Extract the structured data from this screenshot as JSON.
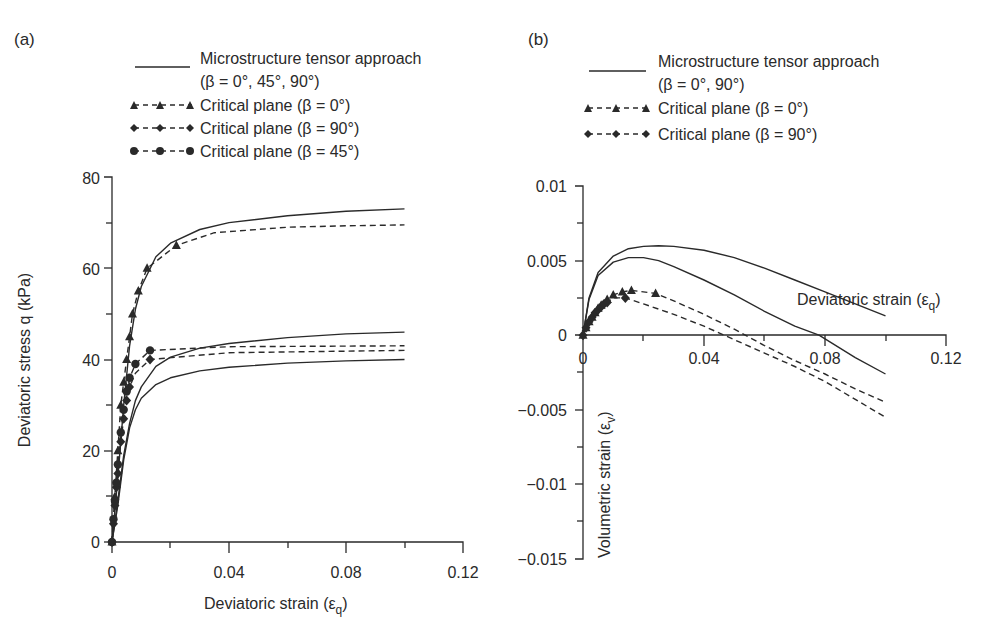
{
  "chart_data": [
    {
      "panel": "(a)",
      "type": "line",
      "title": "",
      "xlabel": "Deviatoric strain (εq)",
      "ylabel": "Deviatoric stress q (kPa)",
      "xlim": [
        0,
        0.12
      ],
      "ylim": [
        0,
        80
      ],
      "xticks": [
        "0",
        "0.04",
        "0.08",
        "0.12"
      ],
      "yticks": [
        "0",
        "20",
        "40",
        "60",
        "80"
      ],
      "grid": false,
      "legend": [
        {
          "label": "Microstructure tensor approach",
          "sublabel": "(β = 0°, 45°, 90°)",
          "style": "solid"
        },
        {
          "label": "Critical plane (β = 0°)",
          "style": "dashed-triangle"
        },
        {
          "label": "Critical plane (β = 90°)",
          "style": "dashed-diamond"
        },
        {
          "label": "Critical plane (β = 45°)",
          "style": "dashed-circle"
        }
      ],
      "series": [
        {
          "name": "Microstructure tensor (β = 0°)",
          "style": "solid",
          "x": [
            0,
            0.002,
            0.004,
            0.006,
            0.008,
            0.01,
            0.015,
            0.02,
            0.03,
            0.04,
            0.06,
            0.08,
            0.1
          ],
          "y": [
            0,
            14,
            30,
            43,
            51,
            56,
            62.5,
            65.5,
            68.5,
            70,
            71.5,
            72.5,
            73
          ]
        },
        {
          "name": "Microstructure tensor (β = 45°)",
          "style": "solid",
          "x": [
            0,
            0.002,
            0.004,
            0.006,
            0.008,
            0.01,
            0.015,
            0.02,
            0.03,
            0.04,
            0.06,
            0.08,
            0.1
          ],
          "y": [
            0,
            9,
            19,
            26,
            31,
            34,
            38.5,
            40.5,
            42.5,
            43.5,
            44.8,
            45.6,
            46
          ]
        },
        {
          "name": "Microstructure tensor (β = 90°)",
          "style": "solid",
          "x": [
            0,
            0.002,
            0.004,
            0.006,
            0.008,
            0.01,
            0.015,
            0.02,
            0.03,
            0.04,
            0.06,
            0.08,
            0.1
          ],
          "y": [
            0,
            8,
            18,
            25,
            29,
            31.5,
            34.5,
            36,
            37.5,
            38.3,
            39.2,
            39.7,
            40
          ]
        },
        {
          "name": "Critical plane (β = 0°)",
          "style": "dashed",
          "marker": "triangle",
          "x": [
            0,
            0.001,
            0.002,
            0.003,
            0.004,
            0.005,
            0.006,
            0.007,
            0.009,
            0.012,
            0.022,
            0.035,
            0.06,
            0.08,
            0.1
          ],
          "y": [
            0,
            10,
            20,
            30,
            35,
            40,
            45,
            50,
            55,
            60,
            65,
            67.8,
            69,
            69.3,
            69.5
          ],
          "markers_x": [
            0,
            0.001,
            0.002,
            0.003,
            0.004,
            0.005,
            0.006,
            0.007,
            0.009,
            0.012,
            0.022
          ],
          "markers_y": [
            0,
            10,
            20,
            30,
            35,
            40,
            45,
            50,
            55,
            60,
            65
          ]
        },
        {
          "name": "Critical plane (β = 90°)",
          "style": "dashed",
          "marker": "diamond",
          "x": [
            0,
            0.001,
            0.002,
            0.003,
            0.004,
            0.005,
            0.006,
            0.008,
            0.013,
            0.04,
            0.1
          ],
          "y": [
            0,
            8,
            15,
            22,
            27,
            31,
            34,
            37,
            40,
            41.5,
            42
          ],
          "markers_x": [
            0,
            0.0005,
            0.001,
            0.0015,
            0.002,
            0.003,
            0.004,
            0.005,
            0.006,
            0.013
          ],
          "markers_y": [
            0,
            4,
            8,
            12,
            15,
            22,
            27,
            31,
            34,
            40
          ]
        },
        {
          "name": "Critical plane (β = 45°)",
          "style": "dashed",
          "marker": "circle",
          "x": [
            0,
            0.001,
            0.002,
            0.003,
            0.004,
            0.005,
            0.006,
            0.008,
            0.013,
            0.04,
            0.1
          ],
          "y": [
            0,
            9,
            17,
            24,
            29,
            33,
            36,
            39,
            42,
            42.8,
            43
          ],
          "markers_x": [
            0,
            0.0005,
            0.001,
            0.0015,
            0.002,
            0.003,
            0.004,
            0.005,
            0.006,
            0.008,
            0.013
          ],
          "markers_y": [
            0,
            5,
            9,
            13,
            17,
            24,
            29,
            33,
            36,
            39,
            42
          ]
        }
      ]
    },
    {
      "panel": "(b)",
      "type": "line",
      "title": "",
      "xlabel": "Deviatoric strain (εq)",
      "ylabel": "Volumetric strain (εv)",
      "xlim": [
        0,
        0.12
      ],
      "ylim": [
        -0.015,
        0.01
      ],
      "xticks": [
        "0",
        "0.04",
        "0.08",
        "0.12"
      ],
      "yticks": [
        "−0.015",
        "−0.01",
        "−0.005",
        "0",
        "0.005",
        "0.01"
      ],
      "grid": false,
      "legend": [
        {
          "label": "Microstructure tensor approach",
          "sublabel": "(β = 0°, 90°)",
          "style": "solid"
        },
        {
          "label": "Critical plane (β = 0°)",
          "style": "dashed-triangle"
        },
        {
          "label": "Critical plane (β = 90°)",
          "style": "dashed-diamond"
        }
      ],
      "series": [
        {
          "name": "Microstructure tensor (upper)",
          "style": "solid",
          "x": [
            0,
            0.002,
            0.005,
            0.01,
            0.015,
            0.02,
            0.025,
            0.03,
            0.04,
            0.05,
            0.06,
            0.07,
            0.08,
            0.09,
            0.1
          ],
          "y": [
            0,
            0.0025,
            0.0042,
            0.0053,
            0.0058,
            0.00595,
            0.006,
            0.00595,
            0.0057,
            0.0052,
            0.0045,
            0.0037,
            0.0029,
            0.0021,
            0.0013
          ]
        },
        {
          "name": "Microstructure tensor (lower)",
          "style": "solid",
          "x": [
            0,
            0.002,
            0.005,
            0.01,
            0.015,
            0.02,
            0.025,
            0.03,
            0.04,
            0.05,
            0.06,
            0.07,
            0.078,
            0.09,
            0.1
          ],
          "y": [
            0,
            0.0024,
            0.004,
            0.0049,
            0.0052,
            0.0052,
            0.005,
            0.0046,
            0.0037,
            0.0027,
            0.0016,
            0.0006,
            0.0,
            -0.0015,
            -0.0026
          ]
        },
        {
          "name": "Critical plane (β = 0°)",
          "style": "dashed",
          "marker": "triangle",
          "x": [
            0,
            0.002,
            0.004,
            0.006,
            0.008,
            0.01,
            0.013,
            0.016,
            0.024,
            0.03,
            0.04,
            0.05,
            0.06,
            0.07,
            0.08,
            0.09,
            0.1
          ],
          "y": [
            0,
            0.0009,
            0.0015,
            0.002,
            0.0024,
            0.0027,
            0.0029,
            0.003,
            0.0028,
            0.0023,
            0.0014,
            0.0004,
            -0.0007,
            -0.0017,
            -0.0026,
            -0.0036,
            -0.0045
          ],
          "markers_x": [
            0,
            0.001,
            0.002,
            0.003,
            0.004,
            0.005,
            0.006,
            0.008,
            0.01,
            0.013,
            0.016,
            0.024
          ],
          "markers_y": [
            0,
            0.0005,
            0.0009,
            0.0012,
            0.0015,
            0.0018,
            0.002,
            0.0024,
            0.0027,
            0.0029,
            0.003,
            0.0028
          ]
        },
        {
          "name": "Critical plane (β = 90°)",
          "style": "dashed",
          "marker": "diamond",
          "x": [
            0,
            0.002,
            0.004,
            0.006,
            0.008,
            0.01,
            0.014,
            0.02,
            0.03,
            0.04,
            0.05,
            0.06,
            0.07,
            0.08,
            0.09,
            0.1
          ],
          "y": [
            0,
            0.0009,
            0.0015,
            0.0019,
            0.0022,
            0.0025,
            0.0025,
            0.0021,
            0.0014,
            0.0006,
            -0.0003,
            -0.0012,
            -0.0021,
            -0.0031,
            -0.0043,
            -0.0055
          ],
          "markers_x": [
            0,
            0.001,
            0.002,
            0.003,
            0.004,
            0.005,
            0.006,
            0.007,
            0.008,
            0.014
          ],
          "markers_y": [
            0,
            0.0005,
            0.0009,
            0.0012,
            0.0015,
            0.0017,
            0.0019,
            0.0021,
            0.0022,
            0.0025
          ]
        }
      ],
      "annotations": [
        "Deviatoric strain (εq)"
      ]
    }
  ],
  "panels": {
    "a": {
      "label": "(a)",
      "legend": {
        "solid_line": "Microstructure tensor approach",
        "solid_line_sub": "(β = 0°, 45°, 90°)",
        "tri": "Critical plane (β = 0°)",
        "dia": "Critical plane (β = 90°)",
        "circ": "Critical plane (β = 45°)"
      },
      "xlabel": "Deviatoric strain (ε",
      "xlabel_sub": "q",
      "ylabel": "Deviatoric stress q (kPa)",
      "xticks": [
        "0",
        "0.04",
        "0.08",
        "0.12"
      ],
      "yticks": [
        "0",
        "20",
        "40",
        "60",
        "80"
      ]
    },
    "b": {
      "label": "(b)",
      "legend": {
        "solid_line": "Microstructure tensor approach",
        "solid_line_sub": "(β = 0°, 90°)",
        "tri": "Critical plane (β = 0°)",
        "dia": "Critical plane (β = 90°)"
      },
      "xlabel": "Deviatoric strain (ε",
      "xlabel_sub": "q",
      "ylabel": "Volumetric strain (ε",
      "ylabel_sub": "v",
      "xticks": [
        "0",
        "0.04",
        "0.08",
        "0.12"
      ],
      "yticks": [
        "0.01",
        "0.005",
        "0",
        "−0.005",
        "−0.01",
        "−0.015"
      ]
    },
    "colors": {
      "ink": "#2a2a2a",
      "background": "#ffffff"
    }
  }
}
